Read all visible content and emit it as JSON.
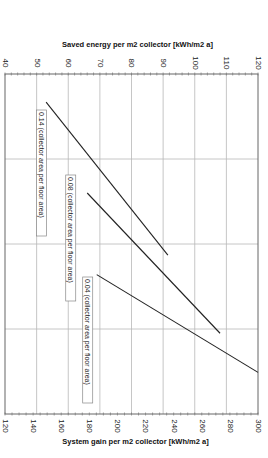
{
  "chart_data": {
    "type": "line",
    "orientation": "rotated-90-clockwise",
    "top_axis": {
      "title": "Saved energy per m2 collector [kWh/m2 a]",
      "range": [
        40,
        120
      ],
      "ticks": [
        "40",
        "50",
        "60",
        "70",
        "80",
        "90",
        "100",
        "110",
        "120"
      ]
    },
    "bottom_axis": {
      "title": "System gain per m2 collector [kWh/m2 a]",
      "range": [
        120,
        300
      ],
      "ticks": [
        "120",
        "140",
        "160",
        "180",
        "200",
        "220",
        "240",
        "260",
        "280",
        "300"
      ]
    },
    "cross_axis": {
      "title": "",
      "divisions": 4,
      "labels_visible": false
    },
    "grid": true,
    "series": [
      {
        "name": "0.14 (collector area per floor area)",
        "saved_energy": [
          53,
          91.5
        ],
        "cross_position": [
          0.33,
          2.13
        ]
      },
      {
        "name": "0.08 (collector area per floor area)",
        "saved_energy": [
          66,
          108
        ],
        "cross_position": [
          1.4,
          3.05
        ]
      },
      {
        "name": "0.04 (collector area per floor area)",
        "saved_energy": [
          69,
          120
        ],
        "cross_position": [
          2.36,
          3.51
        ]
      }
    ]
  }
}
